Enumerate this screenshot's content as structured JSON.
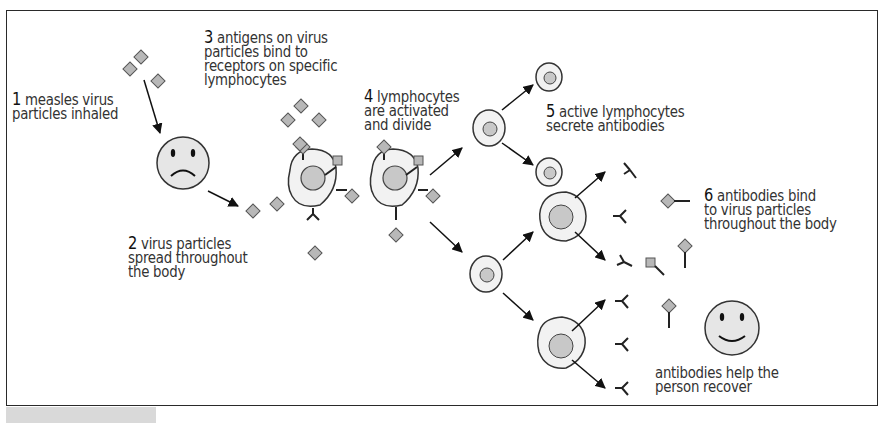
{
  "figure": {
    "colors": {
      "outline": "#222222",
      "virus_fill": "#b8b8b8",
      "cell_fill": "#f2f2f2",
      "nucleus_fill": "#c8c8c8",
      "face_fill": "#e6e6e6",
      "text": "#333333"
    },
    "steps": [
      {
        "number": "1",
        "lines": [
          "measles virus",
          "particles inhaled"
        ]
      },
      {
        "number": "2",
        "lines": [
          "virus particles",
          "spread throughout",
          "the body"
        ]
      },
      {
        "number": "3",
        "lines": [
          "antigens on virus",
          "particles bind to",
          "receptors on specific",
          "lymphocytes"
        ]
      },
      {
        "number": "4",
        "lines": [
          "lymphocytes",
          "are activated",
          "and divide"
        ]
      },
      {
        "number": "5",
        "lines": [
          "active lymphocytes",
          "secrete antibodies"
        ]
      },
      {
        "number": "6",
        "lines": [
          "antibodies bind",
          "to virus particles",
          "throughout the body"
        ]
      },
      {
        "number": "",
        "lines": [
          "antibodies help the",
          "person recover"
        ]
      }
    ],
    "icons": {
      "virus": "diamond-virus-particle",
      "sad_face": "sad-face-icon",
      "happy_face": "happy-face-icon",
      "lymphocyte": "lymphocyte-cell",
      "antibody": "y-shaped-antibody",
      "arrow": "arrow"
    }
  }
}
